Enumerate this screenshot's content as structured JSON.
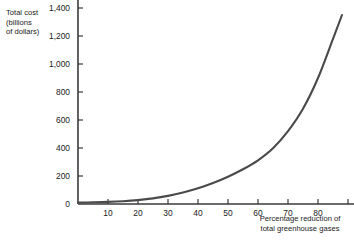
{
  "chart_data": {
    "type": "line",
    "title": "",
    "ylabel": "Total cost\n(billions\nof dollars)",
    "xlabel": "Percentage reduction of\ntotal greenhouse gases",
    "xlim": [
      0,
      92
    ],
    "ylim": [
      0,
      1500
    ],
    "grid": false,
    "legend": null,
    "line_color": "#4a4a4a",
    "axis_color": "#3a3a3a",
    "yticks": [
      0,
      200,
      400,
      600,
      800,
      1000,
      1200,
      1400
    ],
    "ytick_labels": [
      "0",
      "200",
      "400",
      "600",
      "800",
      "1,000",
      "1,200",
      "1,400"
    ],
    "xticks": [
      10,
      20,
      30,
      40,
      50,
      60,
      70,
      80,
      90
    ],
    "xtick_labels": [
      "10",
      "20",
      "30",
      "40",
      "50",
      "60",
      "70",
      "80"
    ],
    "series": [
      {
        "name": "Total cost of greenhouse gas reduction",
        "x": [
          0,
          5,
          10,
          15,
          20,
          25,
          30,
          35,
          40,
          45,
          50,
          55,
          60,
          65,
          70,
          75,
          80,
          85,
          88
        ],
        "values": [
          10,
          12,
          15,
          20,
          28,
          40,
          58,
          82,
          112,
          150,
          195,
          248,
          312,
          398,
          520,
          680,
          900,
          1180,
          1350
        ]
      }
    ]
  }
}
